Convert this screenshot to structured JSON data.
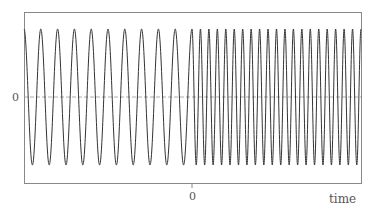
{
  "chart_data": {
    "type": "line",
    "title": "",
    "xlabel": "time",
    "ylabel": "",
    "x_ticks": [
      {
        "value": 0,
        "label": "0"
      }
    ],
    "y_ticks": [
      {
        "value": 0,
        "label": "0"
      }
    ],
    "grid": false,
    "legend": null,
    "series": [
      {
        "name": "signal",
        "description": "cosine wave whose frequency doubles at time 0",
        "segments": [
          {
            "range": "before 0",
            "cycles": 10,
            "amplitude": 1,
            "relative_frequency": 1
          },
          {
            "range": "after 0",
            "cycles": 20,
            "amplitude": 1,
            "relative_frequency": 2
          }
        ]
      }
    ],
    "ylim": [
      -1.2,
      1.2
    ],
    "baseline_style": "dashed"
  },
  "axes": {
    "y_zero_label": "0",
    "x_zero_label": "0",
    "x_axis_label": "time"
  },
  "colors": {
    "frame": "#888888",
    "signal": "#333333",
    "baseline": "#999999",
    "text": "#555555"
  }
}
